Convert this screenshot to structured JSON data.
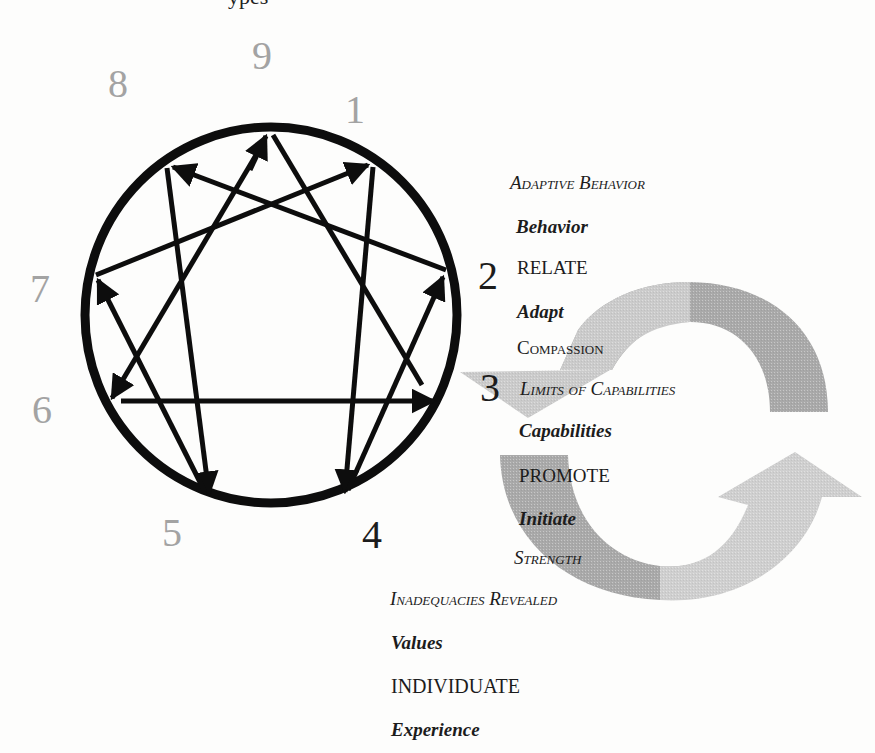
{
  "title_fragment": "ypes",
  "enneagram": {
    "points": [
      {
        "n": "9",
        "tone": "grey"
      },
      {
        "n": "1",
        "tone": "grey"
      },
      {
        "n": "2",
        "tone": "dark"
      },
      {
        "n": "3",
        "tone": "dark"
      },
      {
        "n": "4",
        "tone": "dark"
      },
      {
        "n": "5",
        "tone": "grey"
      },
      {
        "n": "6",
        "tone": "grey"
      },
      {
        "n": "7",
        "tone": "grey"
      },
      {
        "n": "8",
        "tone": "grey"
      }
    ],
    "arrows": [
      {
        "from": "1",
        "to": "4"
      },
      {
        "from": "4",
        "to": "2"
      },
      {
        "from": "2",
        "to": "8"
      },
      {
        "from": "8",
        "to": "5"
      },
      {
        "from": "5",
        "to": "7"
      },
      {
        "from": "7",
        "to": "1"
      },
      {
        "from": "9",
        "to": "3"
      },
      {
        "from": "3",
        "to": "6"
      },
      {
        "from": "6",
        "to": "9"
      }
    ]
  },
  "labels": {
    "adaptive_behavior": "Adaptive Behavior",
    "behavior": "Behavior",
    "relate": "RELATE",
    "adapt": "Adapt",
    "compassion": "Compassion",
    "limits_of_capabilities": "Limits of Capabilities",
    "capabilities": "Capabilities",
    "promote": "PROMOTE",
    "initiate": "Initiate",
    "strength": "Strength",
    "inadequacies_revealed": "Inadequacies Revealed",
    "values": "Values",
    "individuate": "INDIVIDUATE",
    "experience": "Experience"
  },
  "colors": {
    "circle": "#0d0d0d",
    "grey_number": "#a3a3a3",
    "cycle_arrow_light": "#cfcfcf",
    "cycle_arrow_dark": "#a9a9a9"
  }
}
